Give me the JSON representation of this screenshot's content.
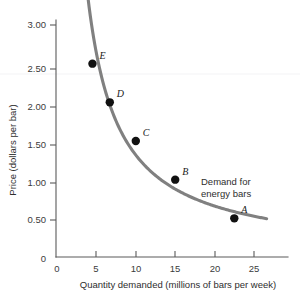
{
  "chart_data": {
    "type": "line",
    "title": "",
    "xlabel": "Quantity demanded (millions of bars per week)",
    "ylabel": "Price (dollars per bar)",
    "xlim": [
      0,
      27
    ],
    "ylim": [
      0,
      3.25
    ],
    "xticks": [
      0,
      5,
      10,
      15,
      20,
      25
    ],
    "xtick_labels": [
      "0",
      "5",
      "10",
      "15",
      "20",
      "25"
    ],
    "yticks": [
      0,
      0.5,
      1.0,
      1.5,
      2.0,
      2.5,
      3.0
    ],
    "ytick_labels": [
      "0",
      "0.50",
      "1.00",
      "1.50",
      "2.00",
      "2.50",
      "3.00"
    ],
    "grid": false,
    "legend": "none",
    "series": [
      {
        "name": "Demand for energy bars",
        "color": "#808080",
        "x": [
          4.5,
          6.7,
          10.0,
          15.0,
          22.5
        ],
        "y": [
          2.5,
          2.0,
          1.5,
          1.0,
          0.5
        ]
      }
    ],
    "points": [
      {
        "label": "E",
        "x": 4.5,
        "y": 2.5,
        "label_dx": 7,
        "label_dy": -5
      },
      {
        "label": "D",
        "x": 6.7,
        "y": 2.0,
        "label_dx": 7,
        "label_dy": -5
      },
      {
        "label": "C",
        "x": 10.0,
        "y": 1.5,
        "label_dx": 7,
        "label_dy": -5
      },
      {
        "label": "B",
        "x": 15.0,
        "y": 1.0,
        "label_dx": 7,
        "label_dy": -5
      },
      {
        "label": "A",
        "x": 22.5,
        "y": 0.5,
        "label_dx": 7,
        "label_dy": -5
      }
    ],
    "annotations": [
      {
        "name": "demand-curve-label",
        "line1": "Demand for",
        "line2": "energy bars",
        "x": 17.3,
        "y": 1.12
      }
    ],
    "colors": {
      "curve": "#808080",
      "point": "#111111",
      "axis": "#5a5a5a",
      "text": "#2e2e2e",
      "background": "#ffffff"
    }
  }
}
